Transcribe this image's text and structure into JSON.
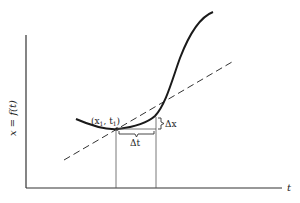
{
  "diagram": {
    "y_axis_label": "x = f(t)",
    "x_axis_label": "t",
    "point_label": "(x",
    "point_label_sub1": "1",
    "point_label_mid": ", t",
    "point_label_sub2": "1",
    "point_label_end": ")",
    "delta_t_label": "Δt",
    "delta_x_label": "Δx",
    "colors": {
      "curve": "#1a1a1a",
      "axis": "#333333",
      "tangent": "#333333",
      "background": "#ffffff"
    }
  }
}
